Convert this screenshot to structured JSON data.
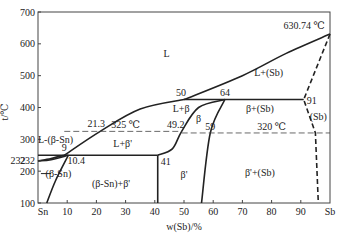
{
  "chart_data": {
    "type": "phase-diagram",
    "title": "",
    "xlabel": "w(Sb)/%",
    "ylabel": "t/℃",
    "xlim": [
      0,
      100
    ],
    "ylim": [
      100,
      700
    ],
    "x_ticks": [
      10,
      20,
      30,
      40,
      50,
      60,
      70,
      80,
      90
    ],
    "x_end_labels": {
      "left": "Sn",
      "right": "Sb"
    },
    "y_ticks": [
      100,
      200,
      232,
      300,
      400,
      500,
      600,
      700
    ],
    "regions": [
      {
        "label": "L",
        "x": 44,
        "y": 560
      },
      {
        "label": "L+(Sb)",
        "x": 79,
        "y": 500
      },
      {
        "label": "L+β",
        "x": 49,
        "y": 385
      },
      {
        "label": "β",
        "x": 55,
        "y": 355
      },
      {
        "label": "β+(Sb)",
        "x": 76,
        "y": 385
      },
      {
        "label": "(Sb)",
        "x": 96,
        "y": 360
      },
      {
        "label": "L+β'",
        "x": 29,
        "y": 275
      },
      {
        "label": "L-(β-Sn)",
        "x": 6,
        "y": 290
      },
      {
        "label": "(β-Sn)",
        "x": 7,
        "y": 183
      },
      {
        "label": "(β-Sn)+β'",
        "x": 25,
        "y": 150
      },
      {
        "label": "β'",
        "x": 50,
        "y": 180
      },
      {
        "label": "β'+(Sb)",
        "x": 76,
        "y": 185
      }
    ],
    "annotations": [
      {
        "text": "630.74 ℃",
        "x": 100,
        "y": 630.74
      },
      {
        "text": "50",
        "x": 50,
        "y": 425
      },
      {
        "text": "64",
        "x": 64,
        "y": 425
      },
      {
        "text": "91",
        "x": 91,
        "y": 425
      },
      {
        "text": "21.3",
        "x": 21.3,
        "y": 325
      },
      {
        "text": "325 ℃",
        "x": 30,
        "y": 325
      },
      {
        "text": "49.2",
        "x": 49.2,
        "y": 325
      },
      {
        "text": "59",
        "x": 59,
        "y": 320
      },
      {
        "text": "320 ℃",
        "x": 80,
        "y": 320
      },
      {
        "text": "9",
        "x": 9,
        "y": 250
      },
      {
        "text": "10.4",
        "x": 10.4,
        "y": 250
      },
      {
        "text": "41",
        "x": 41,
        "y": 250
      },
      {
        "text": "232",
        "x": 0,
        "y": 232
      }
    ],
    "lines": [
      {
        "name": "liquidus-sn-side",
        "style": "solid",
        "points": [
          [
            0,
            232
          ],
          [
            4.5,
            240
          ],
          [
            9,
            250
          ]
        ]
      },
      {
        "name": "liquidus-main",
        "style": "solid",
        "points": [
          [
            9,
            250
          ],
          [
            21.3,
            325
          ],
          [
            35,
            395
          ],
          [
            50,
            425
          ]
        ]
      },
      {
        "name": "liquidus-sb-side",
        "style": "solid",
        "points": [
          [
            50,
            425
          ],
          [
            70,
            500
          ],
          [
            85,
            570
          ],
          [
            100,
            630.74
          ]
        ]
      },
      {
        "name": "solidus-sn",
        "style": "solid",
        "points": [
          [
            0,
            232
          ],
          [
            4.5,
            236
          ],
          [
            10.4,
            250
          ]
        ]
      },
      {
        "name": "solvus-sn",
        "style": "solid",
        "points": [
          [
            3,
            100
          ],
          [
            6,
            170
          ],
          [
            10.4,
            250
          ]
        ]
      },
      {
        "name": "peritectic-250",
        "style": "solid",
        "points": [
          [
            0,
            250
          ],
          [
            41,
            250
          ]
        ]
      },
      {
        "name": "boundary-41",
        "style": "solid",
        "points": [
          [
            41,
            100
          ],
          [
            41,
            250
          ]
        ]
      },
      {
        "name": "peritectic-425",
        "style": "solid",
        "points": [
          [
            50,
            425
          ],
          [
            91,
            425
          ]
        ]
      },
      {
        "name": "beta-left",
        "style": "solid",
        "points": [
          [
            41,
            250
          ],
          [
            46,
            270
          ],
          [
            49.2,
            325
          ],
          [
            55,
            400
          ],
          [
            64,
            425
          ]
        ]
      },
      {
        "name": "beta-right",
        "style": "solid",
        "points": [
          [
            64,
            425
          ],
          [
            59,
            320
          ],
          [
            56,
            100
          ]
        ]
      },
      {
        "name": "sb-solvus",
        "style": "dashed",
        "points": [
          [
            100,
            630.74
          ],
          [
            91,
            425
          ],
          [
            95,
            320
          ],
          [
            96,
            100
          ]
        ]
      },
      {
        "name": "isotherm-325",
        "style": "dashed",
        "points": [
          [
            9,
            325
          ],
          [
            49.2,
            325
          ]
        ]
      },
      {
        "name": "isotherm-320",
        "style": "dashed",
        "points": [
          [
            49.2,
            320
          ],
          [
            100,
            320
          ]
        ]
      }
    ]
  }
}
